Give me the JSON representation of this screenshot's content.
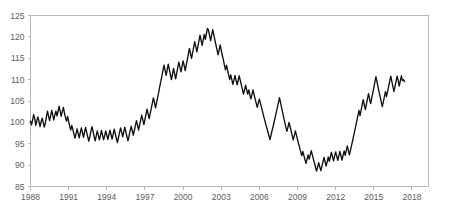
{
  "chart_data": {
    "type": "line",
    "title": "",
    "subtitle": "",
    "xlabel": "",
    "ylabel": "",
    "xlim": [
      1988,
      2019.3
    ],
    "ylim": [
      85,
      125
    ],
    "grid": false,
    "legend": false,
    "legend_position": "none",
    "line_color": "#111111",
    "axis_color": "#b9b9b9",
    "label_color": "#5c5c5c",
    "x_tick_labels": [
      "1988",
      "1991",
      "1994",
      "1997",
      "2000",
      "2003",
      "2006",
      "2009",
      "2012",
      "2015",
      "2018"
    ],
    "x_tick_values": [
      1988,
      1991,
      1994,
      1997,
      2000,
      2003,
      2006,
      2009,
      2012,
      2015,
      2018
    ],
    "y_tick_labels": [
      "85",
      "90",
      "95",
      "100",
      "105",
      "110",
      "115",
      "120",
      "125"
    ],
    "y_tick_values": [
      85,
      90,
      95,
      100,
      105,
      110,
      115,
      120,
      125
    ],
    "series": [
      {
        "name": "index",
        "x_start": 1988.0,
        "x_step": 0.08333,
        "values": [
          100.3,
          99.4,
          100.6,
          101.8,
          100.9,
          99.3,
          100.4,
          101.3,
          100.2,
          99.0,
          100.1,
          101.0,
          100.0,
          98.9,
          99.8,
          101.2,
          102.6,
          101.6,
          100.4,
          101.5,
          102.8,
          101.7,
          100.6,
          101.8,
          102.6,
          101.5,
          102.6,
          103.8,
          102.6,
          101.4,
          102.5,
          103.5,
          102.3,
          101.1,
          100.3,
          101.4,
          100.2,
          99.1,
          98.2,
          99.3,
          98.3,
          97.2,
          96.3,
          97.4,
          98.5,
          97.4,
          96.4,
          97.6,
          98.7,
          97.6,
          96.5,
          97.7,
          98.8,
          97.7,
          96.6,
          95.6,
          96.7,
          97.9,
          99.0,
          97.9,
          96.8,
          95.7,
          96.8,
          98.0,
          97.0,
          95.9,
          96.9,
          98.1,
          97.0,
          95.9,
          96.9,
          98.0,
          97.0,
          96.0,
          97.1,
          98.2,
          97.1,
          96.1,
          97.2,
          98.4,
          97.4,
          96.3,
          95.3,
          96.4,
          97.6,
          98.7,
          97.7,
          96.6,
          97.7,
          98.9,
          97.8,
          96.7,
          95.7,
          96.8,
          98.0,
          99.1,
          98.1,
          97.0,
          98.1,
          99.3,
          100.4,
          99.3,
          98.2,
          99.4,
          100.6,
          101.7,
          100.6,
          99.5,
          100.7,
          101.9,
          103.1,
          102.0,
          100.9,
          102.1,
          103.3,
          104.5,
          105.7,
          104.6,
          103.4,
          104.6,
          105.9,
          107.1,
          108.4,
          109.6,
          110.9,
          112.1,
          113.4,
          112.2,
          111.0,
          112.3,
          113.6,
          112.4,
          111.2,
          110.0,
          111.3,
          112.6,
          111.4,
          110.2,
          111.5,
          112.8,
          114.1,
          113.0,
          111.8,
          113.1,
          114.4,
          113.3,
          112.1,
          113.4,
          114.7,
          116.0,
          117.3,
          116.1,
          115.0,
          116.3,
          117.6,
          118.9,
          117.7,
          116.5,
          117.8,
          119.1,
          120.4,
          119.2,
          118.0,
          119.3,
          120.6,
          119.4,
          120.7,
          122.0,
          121.6,
          120.3,
          119.1,
          120.4,
          121.7,
          120.5,
          119.3,
          118.1,
          117.0,
          115.8,
          116.9,
          118.1,
          116.9,
          115.7,
          114.6,
          113.4,
          112.3,
          113.4,
          112.2,
          111.1,
          110.0,
          111.1,
          110.0,
          108.9,
          109.9,
          111.0,
          109.9,
          108.8,
          109.8,
          110.9,
          109.8,
          108.7,
          107.7,
          106.6,
          107.6,
          108.7,
          107.6,
          106.6,
          107.6,
          106.5,
          105.5,
          106.5,
          107.6,
          106.5,
          105.5,
          104.5,
          103.5,
          104.5,
          105.5,
          104.5,
          103.5,
          102.5,
          101.5,
          100.6,
          99.6,
          98.7,
          97.8,
          96.9,
          96.0,
          97.0,
          98.1,
          99.1,
          100.2,
          101.3,
          102.4,
          103.5,
          104.6,
          105.8,
          104.6,
          103.4,
          102.3,
          101.1,
          100.0,
          98.9,
          97.9,
          98.9,
          100.0,
          99.0,
          97.9,
          96.9,
          95.9,
          96.9,
          98.0,
          97.0,
          96.0,
          95.0,
          94.1,
          93.1,
          92.2,
          93.2,
          92.3,
          91.3,
          90.4,
          91.4,
          92.4,
          91.4,
          92.4,
          93.4,
          92.4,
          91.4,
          90.5,
          89.5,
          88.6,
          89.6,
          90.6,
          89.6,
          88.7,
          89.7,
          90.7,
          91.8,
          90.8,
          89.8,
          90.8,
          91.9,
          90.9,
          91.9,
          93.0,
          92.0,
          91.0,
          92.1,
          93.1,
          92.1,
          91.1,
          92.2,
          93.2,
          92.2,
          91.2,
          92.3,
          93.3,
          92.3,
          93.4,
          94.5,
          93.4,
          92.4,
          93.5,
          94.6,
          95.7,
          96.9,
          98.0,
          99.2,
          100.4,
          101.6,
          102.8,
          101.6,
          102.8,
          104.1,
          105.3,
          104.1,
          103.0,
          104.2,
          105.5,
          106.7,
          105.5,
          104.4,
          105.6,
          106.9,
          108.1,
          109.4,
          110.7,
          109.5,
          108.3,
          107.1,
          106.0,
          104.8,
          103.7,
          104.8,
          106.0,
          107.2,
          106.0,
          107.2,
          108.4,
          109.6,
          110.8,
          109.6,
          108.4,
          107.2,
          108.4,
          109.6,
          110.8,
          109.7,
          108.5,
          109.7,
          110.9,
          109.8,
          110.0,
          109.5
        ]
      }
    ]
  }
}
